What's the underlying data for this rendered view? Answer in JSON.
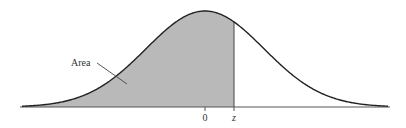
{
  "diagram": {
    "type": "standard-normal-curve",
    "labels": {
      "area": "Area",
      "mean": "0",
      "z": "z"
    },
    "colors": {
      "curve": "#222222",
      "shade": "#b9b9b9",
      "axis": "#555555",
      "text": "#333333"
    },
    "geometry": {
      "baseline_y": 107,
      "peak_y": 11,
      "mean_x": 205,
      "sigma_px": 59,
      "x_start": 22,
      "x_end": 388,
      "z_x": 234
    }
  }
}
